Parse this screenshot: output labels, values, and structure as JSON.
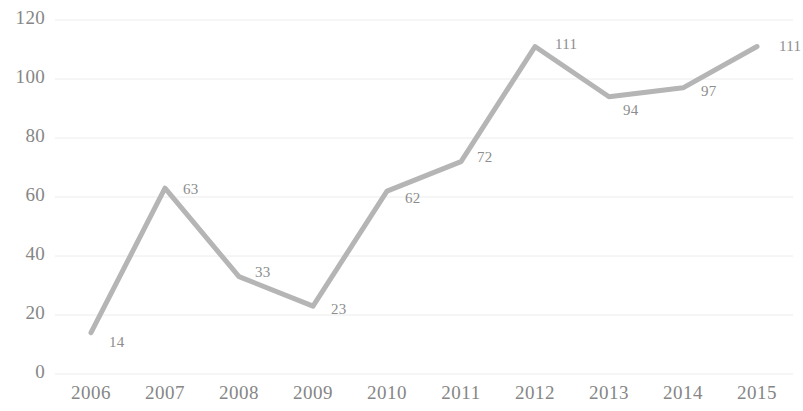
{
  "chart_data": {
    "type": "line",
    "title": "",
    "subtitle": "",
    "xlabel": "",
    "ylabel": "",
    "categories": [
      "2006",
      "2007",
      "2008",
      "2009",
      "2010",
      "2011",
      "2012",
      "2013",
      "2014",
      "2015"
    ],
    "values": [
      14,
      63,
      33,
      23,
      62,
      72,
      111,
      94,
      97,
      111
    ],
    "point_labels": [
      "14",
      "63",
      "33",
      "23",
      "62",
      "72",
      "111",
      "94",
      "97",
      "111"
    ],
    "series": [
      {
        "name": "",
        "values": [
          14,
          63,
          33,
          23,
          62,
          72,
          111,
          94,
          97,
          111
        ]
      }
    ],
    "yticks": [
      0,
      20,
      40,
      60,
      80,
      100,
      120
    ],
    "ytick_labels": [
      "0",
      "20",
      "40",
      "60",
      "80",
      "100",
      "120"
    ],
    "ylim": [
      0,
      120
    ],
    "grid": "horizontal",
    "legend": "none",
    "line_color": "#b5b5b5",
    "grid_color": "#ececed",
    "text_color": "#868686",
    "label_color": "#8d8d8d",
    "background": "#ffffff",
    "label_offsets": [
      {
        "dx": 18,
        "dy": 10
      },
      {
        "dx": 18,
        "dy": 2
      },
      {
        "dx": 16,
        "dy": -4
      },
      {
        "dx": 18,
        "dy": 4
      },
      {
        "dx": 18,
        "dy": 8
      },
      {
        "dx": 16,
        "dy": -4
      },
      {
        "dx": 20,
        "dy": -2
      },
      {
        "dx": 14,
        "dy": 14
      },
      {
        "dx": 18,
        "dy": 4
      },
      {
        "dx": 22,
        "dy": 0
      }
    ]
  }
}
